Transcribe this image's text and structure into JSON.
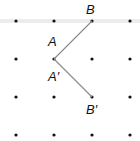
{
  "diagram": {
    "grid": {
      "xs": [
        16,
        54,
        92,
        130
      ],
      "ys": [
        21,
        59,
        97,
        135
      ],
      "dot_color": "#111111"
    },
    "top_band_color": "#e6e6e6",
    "segment_color": "#888888",
    "points": {
      "B": {
        "label": "B",
        "x": 92,
        "y": 21
      },
      "A": {
        "label": "A",
        "x": 54,
        "y": 59
      },
      "B_prime": {
        "label": "B′",
        "x": 92,
        "y": 97
      }
    },
    "labels": {
      "B": "B",
      "A": "A",
      "A_prime": "A′",
      "B_prime": "B′"
    }
  }
}
